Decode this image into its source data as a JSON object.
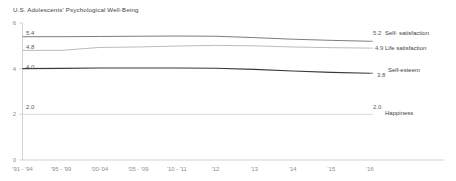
{
  "chart_data": {
    "type": "line",
    "title": "U.S. Adolescents' Psychological Well-Being",
    "xlabel": "",
    "ylabel": "",
    "ylim": [
      0,
      6
    ],
    "yticks": [
      "0",
      "2",
      "4",
      "6"
    ],
    "ytick_values": [
      0,
      2,
      4,
      6
    ],
    "grid": false,
    "legend_position": "right-inline",
    "categories": [
      "'91 - '94",
      "'95 - '99",
      "'00-'04",
      "'05 - '09",
      "'10 - '11",
      "'12",
      "'13",
      "'14",
      "'15",
      "'16"
    ],
    "series": [
      {
        "name": "Self- satisfaction",
        "color": "#6e6e6e",
        "start_label": "5.4",
        "end_label": "5.2",
        "values": [
          5.4,
          5.4,
          5.41,
          5.42,
          5.43,
          5.42,
          5.36,
          5.29,
          5.24,
          5.2
        ]
      },
      {
        "name": "Life satisfaction",
        "color": "#b4b4b4",
        "start_label": "4.8",
        "end_label": "4.9",
        "values": [
          4.8,
          4.8,
          4.93,
          4.95,
          4.99,
          5.02,
          5.0,
          4.95,
          4.92,
          4.9
        ]
      },
      {
        "name": "Self-esteem",
        "color": "#3a3a3a",
        "start_label": "4.0",
        "end_label": "3.8",
        "values": [
          4.0,
          4.01,
          4.03,
          4.03,
          4.03,
          4.02,
          3.97,
          3.9,
          3.84,
          3.8
        ]
      },
      {
        "name": "Happiness",
        "color": "#cfcfcf",
        "start_label": "2.0",
        "end_label": "2.0",
        "values": [
          2.0,
          2.0,
          2.0,
          2.0,
          2.0,
          2.0,
          2.0,
          2.0,
          2.0,
          2.0
        ]
      }
    ]
  }
}
